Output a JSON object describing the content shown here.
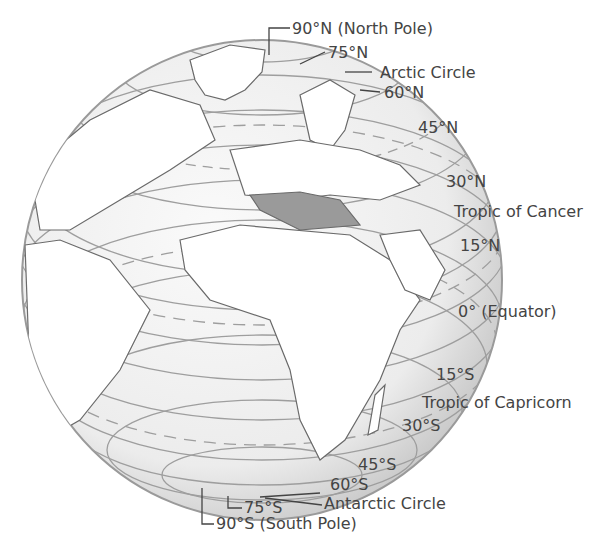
{
  "diagram": {
    "globe": {
      "cx": 262,
      "cy": 280,
      "r": 240,
      "fill": "#f2f2f2",
      "land_fill": "#8a8a8a",
      "line_color": "#999999"
    }
  },
  "labels": {
    "north_pole": "90°N (North Pole)",
    "lat_75n": "75°N",
    "arctic_circle": "Arctic Circle",
    "lat_60n": "60°N",
    "lat_45n": "45°N",
    "lat_30n": "30°N",
    "tropic_cancer": "Tropic of Cancer",
    "lat_15n": "15°N",
    "equator": "0° (Equator)",
    "lat_15s": "15°S",
    "tropic_capricorn": "Tropic of Capricorn",
    "lat_30s": "30°S",
    "lat_45s": "45°S",
    "lat_60s": "60°S",
    "antarctic_circle": "Antarctic Circle",
    "lat_75s": "75°S",
    "south_pole": "90°S (South Pole)"
  }
}
